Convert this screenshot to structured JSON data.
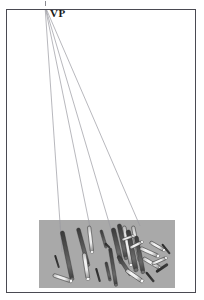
{
  "figure": {
    "title_label": "VP",
    "frame": {
      "x": 6,
      "y": 9,
      "width": 190,
      "height": 284,
      "border_color": "#4a4a52",
      "fill": "#ffffff"
    },
    "vanishing_point": {
      "x": 45,
      "y": 6,
      "label": "VP"
    },
    "ground_plane": {
      "x": 39,
      "y": 220,
      "width": 136,
      "height": 68,
      "fill": "#a9a9a9"
    },
    "colors": {
      "background": "#ffffff",
      "frame_border": "#4a4a52",
      "ground": "#a9a9a9",
      "sight_line": "#9a9aa0",
      "rod_shaft": "#4d4d4d",
      "rod_shaft_dark": "#3a3a3a",
      "rod_highlight": "#f2f2f2",
      "rod_outline": "#2b2b2b",
      "shadow": "#2e2e2e",
      "label_text": "#1a1a1a"
    },
    "sight_lines": [
      {
        "id": "line-1",
        "x1": 45,
        "y1": 6,
        "x2": 62,
        "y2": 252
      },
      {
        "id": "line-2",
        "x1": 45,
        "y1": 6,
        "x2": 91,
        "y2": 232
      },
      {
        "id": "line-3",
        "x1": 45,
        "y1": 6,
        "x2": 113,
        "y2": 236
      },
      {
        "id": "line-4",
        "x1": 45,
        "y1": 6,
        "x2": 140,
        "y2": 226
      }
    ],
    "rods": [
      {
        "id": "rod-01",
        "x1": 62,
        "y1": 231,
        "x2": 72,
        "y2": 279,
        "w": 4.0,
        "shade": "dark"
      },
      {
        "id": "rod-02",
        "x1": 53,
        "y1": 275,
        "x2": 71,
        "y2": 281,
        "w": 3.6,
        "shade": "light"
      },
      {
        "id": "rod-03",
        "x1": 55,
        "y1": 255,
        "x2": 59,
        "y2": 268,
        "w": 2.0,
        "shade": "shadow"
      },
      {
        "id": "rod-04",
        "x1": 78,
        "y1": 228,
        "x2": 88,
        "y2": 265,
        "w": 3.6,
        "shade": "dark"
      },
      {
        "id": "rod-05",
        "x1": 89,
        "y1": 226,
        "x2": 92,
        "y2": 252,
        "w": 3.4,
        "shade": "light"
      },
      {
        "id": "rod-06",
        "x1": 84,
        "y1": 253,
        "x2": 88,
        "y2": 279,
        "w": 3.8,
        "shade": "light"
      },
      {
        "id": "rod-07",
        "x1": 101,
        "y1": 230,
        "x2": 106,
        "y2": 247,
        "w": 2.6,
        "shade": "dark"
      },
      {
        "id": "rod-08",
        "x1": 105,
        "y1": 243,
        "x2": 110,
        "y2": 248,
        "w": 2.0,
        "shade": "shadow"
      },
      {
        "id": "rod-09",
        "x1": 110,
        "y1": 248,
        "x2": 116,
        "y2": 285,
        "w": 3.2,
        "shade": "dark"
      },
      {
        "id": "rod-10",
        "x1": 113,
        "y1": 228,
        "x2": 121,
        "y2": 262,
        "w": 4.2,
        "shade": "dark"
      },
      {
        "id": "rod-11",
        "x1": 119,
        "y1": 224,
        "x2": 126,
        "y2": 258,
        "w": 4.0,
        "shade": "dark"
      },
      {
        "id": "rod-12",
        "x1": 124,
        "y1": 226,
        "x2": 131,
        "y2": 265,
        "w": 3.6,
        "shade": "light"
      },
      {
        "id": "rod-13",
        "x1": 128,
        "y1": 230,
        "x2": 136,
        "y2": 270,
        "w": 4.4,
        "shade": "dark"
      },
      {
        "id": "rod-14",
        "x1": 133,
        "y1": 226,
        "x2": 140,
        "y2": 262,
        "w": 3.4,
        "shade": "light"
      },
      {
        "id": "rod-15",
        "x1": 136,
        "y1": 236,
        "x2": 143,
        "y2": 272,
        "w": 4.0,
        "shade": "dark"
      },
      {
        "id": "rod-16",
        "x1": 118,
        "y1": 256,
        "x2": 130,
        "y2": 274,
        "w": 3.4,
        "shade": "dark"
      },
      {
        "id": "rod-17",
        "x1": 126,
        "y1": 270,
        "x2": 142,
        "y2": 281,
        "w": 3.8,
        "shade": "light"
      },
      {
        "id": "rod-18",
        "x1": 140,
        "y1": 248,
        "x2": 158,
        "y2": 256,
        "w": 3.6,
        "shade": "light"
      },
      {
        "id": "rod-19",
        "x1": 143,
        "y1": 258,
        "x2": 160,
        "y2": 268,
        "w": 3.6,
        "shade": "light"
      },
      {
        "id": "rod-20",
        "x1": 150,
        "y1": 242,
        "x2": 164,
        "y2": 250,
        "w": 3.2,
        "shade": "light"
      },
      {
        "id": "rod-21",
        "x1": 152,
        "y1": 264,
        "x2": 166,
        "y2": 258,
        "w": 3.0,
        "shade": "light"
      },
      {
        "id": "rod-22",
        "x1": 156,
        "y1": 272,
        "x2": 168,
        "y2": 264,
        "w": 2.8,
        "shade": "shadow"
      },
      {
        "id": "rod-23",
        "x1": 146,
        "y1": 272,
        "x2": 154,
        "y2": 282,
        "w": 2.4,
        "shade": "shadow"
      },
      {
        "id": "rod-24",
        "x1": 162,
        "y1": 244,
        "x2": 170,
        "y2": 254,
        "w": 2.2,
        "shade": "shadow"
      },
      {
        "id": "rod-25",
        "x1": 96,
        "y1": 268,
        "x2": 100,
        "y2": 282,
        "w": 2.2,
        "shade": "shadow"
      },
      {
        "id": "rod-26",
        "x1": 106,
        "y1": 262,
        "x2": 110,
        "y2": 280,
        "w": 2.6,
        "shade": "dark"
      },
      {
        "id": "rod-27",
        "x1": 130,
        "y1": 248,
        "x2": 142,
        "y2": 242,
        "w": 3.0,
        "shade": "light"
      },
      {
        "id": "rod-28",
        "x1": 122,
        "y1": 240,
        "x2": 133,
        "y2": 236,
        "w": 2.6,
        "shade": "light"
      }
    ]
  }
}
